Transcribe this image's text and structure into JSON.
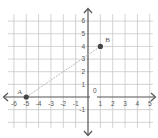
{
  "chart_data": {
    "type": "scatter",
    "title": "",
    "xlabel": "",
    "ylabel": "",
    "xlim": [
      -6,
      5
    ],
    "ylim": [
      -2,
      6
    ],
    "grid": true,
    "x_ticks": [
      -6,
      -5,
      -4,
      -3,
      -2,
      -1,
      1,
      2,
      3,
      4,
      5
    ],
    "y_ticks": [
      1,
      2,
      3,
      4,
      5,
      6,
      -1
    ],
    "origin_label": "0",
    "points": [
      {
        "label": "A",
        "x": -5,
        "y": 0
      },
      {
        "label": "B",
        "x": 1,
        "y": 4
      }
    ],
    "segments": [
      {
        "from": "A",
        "to": "B",
        "style": "dashed"
      }
    ]
  },
  "colors": {
    "grid": "#c8c8c8",
    "axis": "#555555",
    "point": "#444444",
    "segment": "#bdbdbd"
  }
}
